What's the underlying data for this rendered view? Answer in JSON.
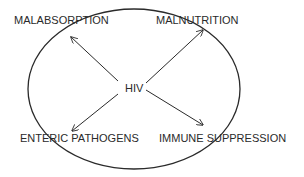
{
  "diagram": {
    "center": {
      "label": "HIV"
    },
    "nodes": [
      {
        "id": "malabsorption",
        "label": "MALABSORPTION"
      },
      {
        "id": "malnutrition",
        "label": "MALNUTRITION"
      },
      {
        "id": "enteric-pathogens",
        "label": "ENTERIC PATHOGENS"
      },
      {
        "id": "immune-suppression",
        "label": "IMMUNE SUPPRESSION"
      }
    ],
    "edges": [
      {
        "from": "HIV",
        "to": "MALABSORPTION"
      },
      {
        "from": "HIV",
        "to": "MALNUTRITION"
      },
      {
        "from": "HIV",
        "to": "ENTERIC PATHOGENS"
      },
      {
        "from": "HIV",
        "to": "IMMUNE SUPPRESSION"
      }
    ],
    "colors": {
      "stroke": "#2a2a2a",
      "background": "#ffffff"
    }
  }
}
